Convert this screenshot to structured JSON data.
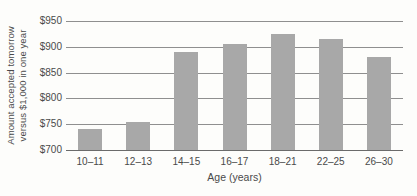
{
  "chart_data": {
    "type": "bar",
    "title": "",
    "categories": [
      "10–11",
      "12–13",
      "14–15",
      "16–17",
      "18–21",
      "22–25",
      "26–30"
    ],
    "values": [
      740,
      755,
      890,
      905,
      925,
      915,
      880
    ],
    "xlabel": "Age (years)",
    "ylabel": "Amount accepted tomorrow versus $1,000 in one year",
    "ylabel_lines": [
      "Amount accepted tomorrow",
      "versus $1,000 in one year"
    ],
    "ylim": [
      700,
      950
    ],
    "yticks": [
      700,
      750,
      800,
      850,
      900,
      950
    ],
    "ytick_labels": [
      "$700",
      "$750",
      "$800",
      "$850",
      "$900",
      "$950"
    ],
    "grid": true,
    "legend": false,
    "colors": {
      "bar": "#a8a8a8",
      "gridline": "#8f8f8f",
      "axis": "#6b6b6b",
      "text": "#4a4a4a",
      "background": "#fdfdfb"
    }
  }
}
